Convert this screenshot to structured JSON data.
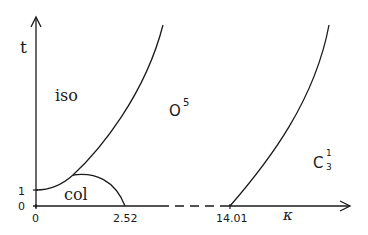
{
  "diagram": {
    "type": "phase-diagram",
    "axes": {
      "y_label": "t",
      "x_label": "κ",
      "y_ticks": [
        "1",
        "0"
      ],
      "x_ticks": [
        "0",
        "2.52",
        "14.01"
      ]
    },
    "regions": {
      "iso": "iso",
      "col": "col",
      "o5_base": "O",
      "o5_sup": "5",
      "c31_base": "C",
      "c31_sup": "1",
      "c31_sub": "3"
    },
    "colors": {
      "line": "#1a1a1a",
      "background": "#ffffff"
    }
  }
}
